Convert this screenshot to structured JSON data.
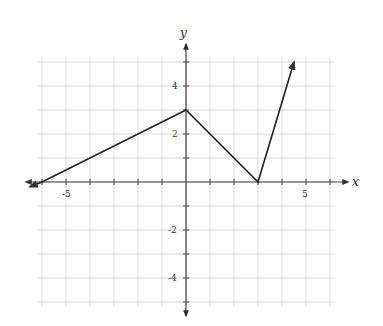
{
  "chart_data": {
    "type": "line",
    "title": "",
    "xlabel": "x",
    "ylabel": "y",
    "xlim": [
      -6,
      6
    ],
    "ylim": [
      -5,
      5
    ],
    "grid": true,
    "x_tick_labels": [
      {
        "value": -5,
        "label": "-5"
      },
      {
        "value": 5,
        "label": "5"
      }
    ],
    "y_tick_labels": [
      {
        "value": 4,
        "label": "4"
      },
      {
        "value": 2,
        "label": "2"
      },
      {
        "value": -2,
        "label": "-2"
      },
      {
        "value": -4,
        "label": "-4"
      }
    ],
    "series": [
      {
        "name": "piecewise linear function",
        "points": [
          [
            -6.5,
            -0.2
          ],
          [
            -6,
            0
          ],
          [
            0,
            3
          ],
          [
            3,
            0
          ],
          [
            4.5,
            5
          ]
        ],
        "arrow_start": true,
        "arrow_end": true,
        "color": "#222222"
      }
    ],
    "annotations": []
  },
  "labels": {
    "x_axis": "x",
    "y_axis": "y",
    "x_neg5": "-5",
    "x_pos5": "5",
    "y_4": "4",
    "y_2": "2",
    "y_neg2": "-2",
    "y_neg4": "-4"
  },
  "colors": {
    "grid": "#cfcfcf",
    "axis": "#444444",
    "curve": "#222222"
  }
}
